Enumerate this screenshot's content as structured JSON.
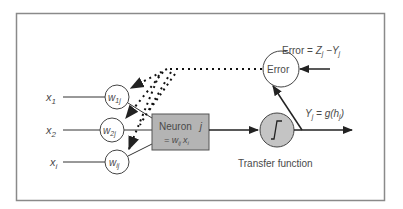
{
  "diagram": {
    "colors": {
      "frame": "#8a8a8a",
      "line": "#222222",
      "neuron_fill": "#b4b4b4",
      "transfer_fill": "#c4c4c4",
      "text": "#4a4a4a"
    },
    "inputs": [
      {
        "label": "x",
        "sub": "1"
      },
      {
        "label": "x",
        "sub": "2"
      },
      {
        "label": "x",
        "sub": "i"
      }
    ],
    "weights": [
      {
        "label": "w",
        "sub": "1j"
      },
      {
        "label": "w",
        "sub": "2j"
      },
      {
        "label": "w",
        "sub": "ij"
      }
    ],
    "neuron": {
      "line1": "Neuron",
      "index": "j",
      "line2_prefix": "= w",
      "line2_sub": "ij",
      "line2_var": "x",
      "line2_var_sub": "i"
    },
    "error_node": {
      "label": "Error"
    },
    "error_equation": {
      "prefix": "Error = ",
      "z": "Z",
      "z_sub": "j",
      "minus": " −Y",
      "y_sub": "j"
    },
    "transfer": {
      "symbol": "∫",
      "caption": "Transfer function"
    },
    "output_equation": {
      "y": "Y",
      "y_sub": "j",
      "mid": " = g(h",
      "h_sub": "j",
      "end": ")"
    }
  }
}
